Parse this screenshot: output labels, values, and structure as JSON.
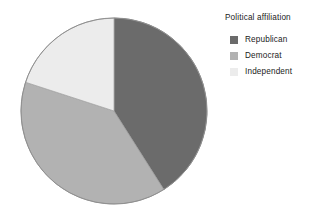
{
  "chart_data": {
    "type": "pie",
    "title": "",
    "legend_title": "Political affiliation",
    "legend_position": "right",
    "grid": false,
    "categories": [
      "Republican",
      "Democrat",
      "Independent"
    ],
    "values": [
      41,
      39,
      20
    ],
    "value_unit": "percent",
    "start_angle_deg": 0,
    "direction": "clockwise",
    "slices": [
      {
        "label": "Republican",
        "value": 41,
        "percent": 41,
        "angle_deg": 147,
        "start_angle_deg": 0,
        "end_angle_deg": 147,
        "color": "#6b6b6b"
      },
      {
        "label": "Democrat",
        "value": 39,
        "percent": 39,
        "angle_deg": 139,
        "start_angle_deg": 147,
        "end_angle_deg": 286,
        "color": "#b2b2b2"
      },
      {
        "label": "Independent",
        "value": 20,
        "percent": 20,
        "angle_deg": 74,
        "start_angle_deg": 286,
        "end_angle_deg": 360,
        "color": "#ececec"
      }
    ],
    "xlabel": "",
    "ylabel": ""
  },
  "legend": {
    "title": "Political affiliation",
    "items": [
      {
        "label": "Republican",
        "color": "#6b6b6b"
      },
      {
        "label": "Democrat",
        "color": "#b2b2b2"
      },
      {
        "label": "Independent",
        "color": "#ececec"
      }
    ]
  },
  "colors": {
    "background": "#ffffff",
    "text": "#1b1b1b",
    "outline": "#8a8a8a",
    "republican": "#6b6b6b",
    "democrat": "#b2b2b2",
    "independent": "#ececec"
  },
  "geometry": {
    "center_x": 114,
    "center_y": 111,
    "radius": 93
  }
}
